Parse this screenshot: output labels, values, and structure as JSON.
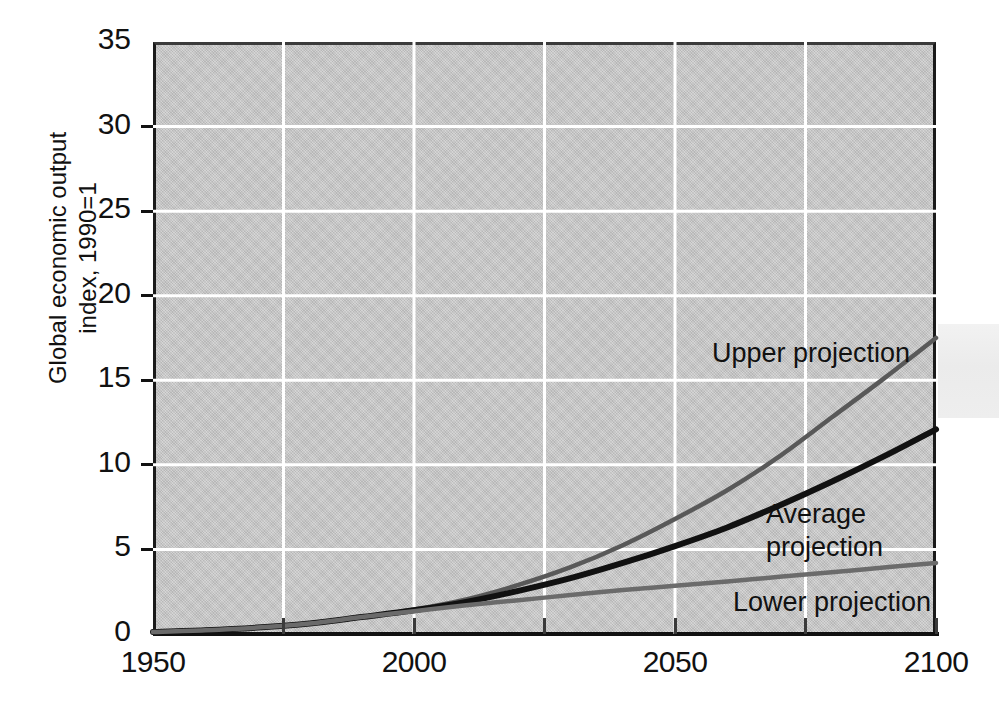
{
  "chart_data": {
    "type": "line",
    "title": "",
    "xlabel": "",
    "ylabel_lines": [
      "Global economic output",
      "index, 1990=1"
    ],
    "ylabel": "Global economic output index, 1990=1",
    "xlim": [
      1950,
      2100
    ],
    "ylim": [
      0,
      35
    ],
    "x_ticks": [
      1950,
      2000,
      2050,
      2100
    ],
    "x_tick_labels": [
      "1950",
      "2000",
      "2050",
      "2100"
    ],
    "x_minor_ticks": [
      1975,
      2025,
      2075
    ],
    "y_ticks": [
      0,
      5,
      10,
      15,
      20,
      25,
      30,
      35
    ],
    "y_tick_labels": [
      "0",
      "5",
      "10",
      "15",
      "20",
      "25",
      "30",
      "35"
    ],
    "grid": "white horizontal gridlines at every major y tick, white vertical gridlines every 25 years",
    "legend": "inline annotations next to each curve",
    "plot_background": "#c9c9c9",
    "x": [
      1950,
      1960,
      1970,
      1980,
      1990,
      2000,
      2010,
      2020,
      2030,
      2040,
      2050,
      2060,
      2070,
      2080,
      2090,
      2100
    ],
    "series": [
      {
        "name": "Upper projection",
        "color": "#595959",
        "values": [
          0.12,
          0.22,
          0.38,
          0.62,
          1.0,
          1.45,
          2.05,
          2.9,
          3.95,
          5.25,
          6.8,
          8.5,
          10.5,
          12.8,
          15.1,
          17.5
        ]
      },
      {
        "name": "Average projection",
        "color": "#111111",
        "values": [
          0.12,
          0.22,
          0.38,
          0.62,
          1.0,
          1.4,
          1.9,
          2.55,
          3.3,
          4.2,
          5.2,
          6.3,
          7.6,
          9.0,
          10.5,
          12.1
        ]
      },
      {
        "name": "Lower projection",
        "color": "#6b6b6b",
        "values": [
          0.12,
          0.22,
          0.38,
          0.62,
          1.0,
          1.35,
          1.7,
          2.0,
          2.3,
          2.6,
          2.85,
          3.1,
          3.38,
          3.65,
          3.93,
          4.2
        ]
      }
    ],
    "annotations": [
      {
        "text": "Upper projection",
        "near_series": "Upper projection"
      },
      {
        "text": "Average projection",
        "near_series": "Average projection"
      },
      {
        "text": "Lower projection",
        "near_series": "Lower projection"
      }
    ]
  },
  "annotations": {
    "upper": "Upper projection",
    "average_line1": "Average",
    "average_line2": "projection",
    "lower": "Lower projection"
  }
}
